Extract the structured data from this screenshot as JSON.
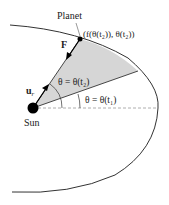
{
  "diagram": {
    "labels": {
      "planet": "Planet",
      "planet_coord": "(f(θ(t₂)), θ(t₂))",
      "force": "F",
      "unit_radial": "u",
      "unit_radial_sub": "r",
      "theta2": "θ = θ(t₂)",
      "theta1": "θ = θ(t₁)",
      "sun": "Sun"
    },
    "colors": {
      "orbit": "#333333",
      "shaded_region": "#d6d6d6",
      "dashed_axis": "#999999",
      "sun": "#000000"
    }
  }
}
